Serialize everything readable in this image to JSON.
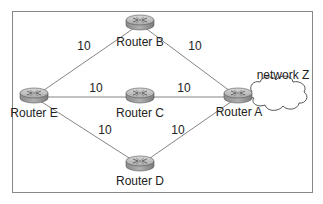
{
  "diagram": {
    "frame": {
      "x": 12,
      "y": 11,
      "w": 301,
      "h": 182,
      "color": "#888888"
    },
    "routers": [
      {
        "id": "B",
        "label": "Router B",
        "x": 140,
        "y": 22,
        "label_x": 140,
        "label_y": 46
      },
      {
        "id": "E",
        "label": "Router E",
        "x": 34,
        "y": 95,
        "label_x": 34,
        "label_y": 117
      },
      {
        "id": "C",
        "label": "Router C",
        "x": 140,
        "y": 95,
        "label_x": 140,
        "label_y": 117
      },
      {
        "id": "A",
        "label": "Router A",
        "x": 238,
        "y": 95,
        "label_x": 239,
        "label_y": 116
      },
      {
        "id": "D",
        "label": "Router D",
        "x": 140,
        "y": 163,
        "label_x": 140,
        "label_y": 185
      }
    ],
    "links": [
      {
        "from": "E",
        "to": "B",
        "cost": "10",
        "label_x": 84,
        "label_y": 50
      },
      {
        "from": "B",
        "to": "A",
        "cost": "10",
        "label_x": 195,
        "label_y": 50
      },
      {
        "from": "E",
        "to": "C",
        "cost": "10",
        "label_x": 96,
        "label_y": 92
      },
      {
        "from": "C",
        "to": "A",
        "cost": "10",
        "label_x": 184,
        "label_y": 92
      },
      {
        "from": "E",
        "to": "D",
        "cost": "10",
        "label_x": 105,
        "label_y": 134
      },
      {
        "from": "D",
        "to": "A",
        "cost": "10",
        "label_x": 178,
        "label_y": 134
      }
    ],
    "network": {
      "label": "network Z",
      "label_x": 283,
      "label_y": 79
    }
  }
}
